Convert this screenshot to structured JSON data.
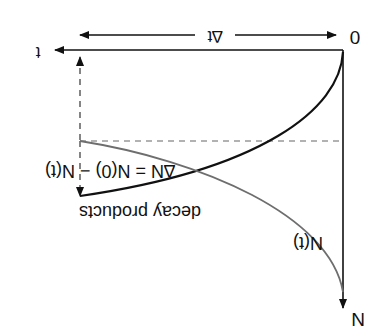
{
  "diagram": {
    "rotation_deg": 180,
    "labels": {
      "origin": "0",
      "time_axis": "t",
      "n_axis": "N",
      "delta_t": "∆t",
      "delta_n": "∆N = N(0) − N(t)",
      "decay_products": "decay products",
      "n_of_t": "N(t)"
    },
    "colors": {
      "axes": "#111111",
      "decay_products_curve": "#111111",
      "n_of_t_curve": "#6e6e6e",
      "dashed": "#555555",
      "background": "#ffffff"
    }
  }
}
